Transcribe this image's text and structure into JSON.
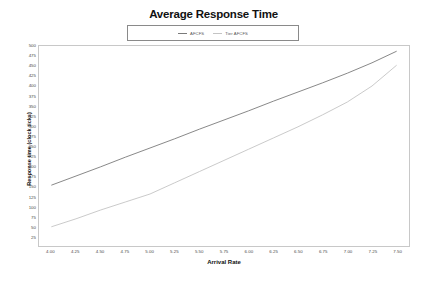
{
  "chart_data": {
    "type": "line",
    "title": "Average Response Time",
    "xlabel": "Arrival Rate",
    "ylabel": "Response time (clock ticks)",
    "xlim": [
      3.875,
      7.625
    ],
    "ylim": [
      0,
      500
    ],
    "grid": false,
    "legend_position": "top-center",
    "xticks": [
      "4.00",
      "4.25",
      "4.50",
      "4.75",
      "5.00",
      "5.25",
      "5.50",
      "5.75",
      "6.00",
      "6.25",
      "6.50",
      "6.75",
      "7.00",
      "7.25",
      "7.50"
    ],
    "yticks": [
      "500",
      "475",
      "450",
      "425",
      "400",
      "375",
      "350",
      "325",
      "300",
      "275",
      "250",
      "225",
      "200",
      "175",
      "150",
      "125",
      "100",
      "75",
      "50",
      "25"
    ],
    "x": [
      4.0,
      4.25,
      4.5,
      4.75,
      5.0,
      5.25,
      5.5,
      5.75,
      6.0,
      6.25,
      6.5,
      6.75,
      7.0,
      7.25,
      7.5
    ],
    "series": [
      {
        "name": "AFCFS",
        "color": "#7a7a7a",
        "values": [
          152,
          175,
          198,
          222,
          245,
          268,
          292,
          315,
          338,
          362,
          385,
          408,
          432,
          458,
          487
        ]
      },
      {
        "name": "Tier AFCFS",
        "color": "#c4c4c4",
        "values": [
          48,
          68,
          90,
          110,
          130,
          158,
          186,
          214,
          242,
          270,
          298,
          328,
          360,
          400,
          452
        ]
      }
    ]
  },
  "legend": {
    "entries": [
      {
        "label": "AFCFS"
      },
      {
        "label": "Tier AFCFS"
      }
    ]
  }
}
